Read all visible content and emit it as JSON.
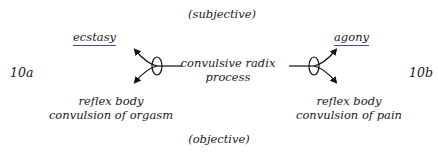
{
  "diagram": {
    "top_label": "(subjective)",
    "bottom_label": "(objective)",
    "left_id": "10a",
    "right_id": "10b",
    "center": {
      "line1": "convulsive radix",
      "line2": "process"
    },
    "left": {
      "top_label": "ecstasy",
      "bottom_line1": "reflex body",
      "bottom_line2": "convulsion of orgasm"
    },
    "right": {
      "top_label": "agony",
      "bottom_line1": "reflex body",
      "bottom_line2": "convulsion of pain"
    },
    "colors": {
      "text": "#1a1a1a",
      "underline": "#4a4a8a",
      "line": "#111111"
    }
  }
}
